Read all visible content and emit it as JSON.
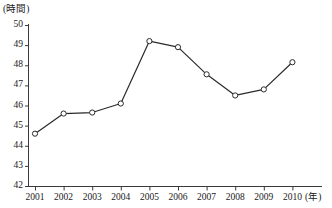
{
  "chart_data": {
    "type": "line",
    "title": "",
    "subtitle": "",
    "xlabel": "(年)",
    "ylabel": "(時間)",
    "x": [
      2001,
      2002,
      2003,
      2004,
      2005,
      2006,
      2007,
      2008,
      2009,
      2010
    ],
    "categories": [
      "2001",
      "2002",
      "2003",
      "2004",
      "2005",
      "2006",
      "2007",
      "2008",
      "2009",
      "2010"
    ],
    "values": [
      44.6,
      45.6,
      45.65,
      46.1,
      49.2,
      48.9,
      47.55,
      46.5,
      46.8,
      48.15
    ],
    "series": [
      {
        "name": "",
        "values": [
          44.6,
          45.6,
          45.65,
          46.1,
          49.2,
          48.9,
          47.55,
          46.5,
          46.8,
          48.15
        ]
      }
    ],
    "ylim": [
      42,
      50
    ],
    "yticks": [
      42,
      43,
      44,
      45,
      46,
      47,
      48,
      49,
      50
    ],
    "ytick_labels": [
      "42",
      "43",
      "44",
      "45",
      "46",
      "47",
      "48",
      "49",
      "50"
    ],
    "xticks": [
      2001,
      2002,
      2003,
      2004,
      2005,
      2006,
      2007,
      2008,
      2009,
      2010
    ],
    "xtick_labels": [
      "2001",
      "2002",
      "2003",
      "2004",
      "2005",
      "2006",
      "2007",
      "2008",
      "2009",
      "2010"
    ],
    "grid": false,
    "legend": false,
    "legend_position": "none",
    "marker": "open-circle",
    "line_color": "#2a2a2a",
    "marker_fill": "#ffffff",
    "marker_stroke": "#2a2a2a",
    "axis_color": "#3a3a3a"
  },
  "axes": {
    "y_unit": "(時間)",
    "x_unit": "(年)"
  }
}
